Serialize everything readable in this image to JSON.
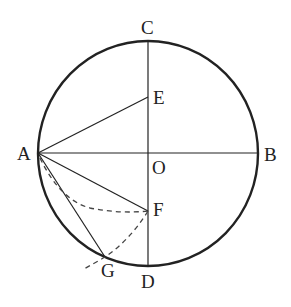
{
  "diagram": {
    "type": "geometry",
    "colors": {
      "stroke": "#222222",
      "background": "#ffffff",
      "dashed": "#444444"
    },
    "points": {
      "A": {
        "label": "A",
        "x": 38,
        "y": 153
      },
      "B": {
        "label": "B",
        "x": 258,
        "y": 153
      },
      "C": {
        "label": "C",
        "x": 148,
        "y": 41
      },
      "D": {
        "label": "D",
        "x": 148,
        "y": 266
      },
      "O": {
        "label": "O",
        "x": 148,
        "y": 153
      },
      "E": {
        "label": "E",
        "x": 148,
        "y": 97
      },
      "F": {
        "label": "F",
        "x": 148,
        "y": 211
      },
      "G": {
        "label": "G",
        "x": 105,
        "y": 257
      }
    },
    "segments": [
      [
        "A",
        "B"
      ],
      [
        "C",
        "D"
      ],
      [
        "A",
        "E"
      ],
      [
        "A",
        "F"
      ],
      [
        "A",
        "G"
      ]
    ],
    "dashed_arcs": [
      {
        "name": "arc-A-to-F",
        "description": "arc centered near G from A to F"
      },
      {
        "name": "arc-F-to-G",
        "description": "arc centered at A from F through G"
      }
    ]
  }
}
